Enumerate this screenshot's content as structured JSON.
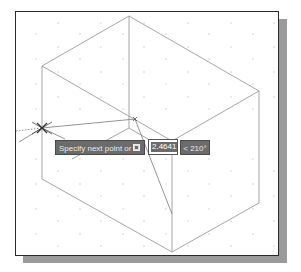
{
  "canvas": {
    "background": "#ffffff",
    "line_color": "#8a8a8a",
    "grid_dot_color": "#c8c8c8",
    "shadow_color": "#9a9a9a",
    "frame_color": "#2a2a2a"
  },
  "dynamic_input": {
    "prompt": "Specify next point or",
    "option_icon": "down-arrow-options-icon",
    "distance_value": "2.4641",
    "angle_value": "< 210°"
  },
  "cursor": {
    "icon": "crosshair-cursor-icon"
  }
}
